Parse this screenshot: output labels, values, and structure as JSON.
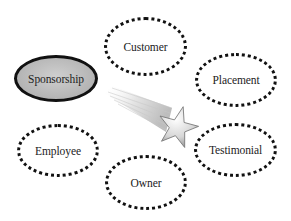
{
  "diagram": {
    "type": "hub-and-spoke",
    "hub": {
      "label": "Sponsorship",
      "style": "solid-filled-gray"
    },
    "nodes": [
      {
        "id": "customer",
        "label": "Customer"
      },
      {
        "id": "placement",
        "label": "Placement"
      },
      {
        "id": "testimonial",
        "label": "Testimonial"
      },
      {
        "id": "owner",
        "label": "Owner"
      },
      {
        "id": "employee",
        "label": "Employee"
      }
    ],
    "center_graphic": "shooting-star",
    "colors": {
      "hub_fill": "#b8b8b8",
      "outline": "#111111",
      "background": "#ffffff"
    }
  }
}
